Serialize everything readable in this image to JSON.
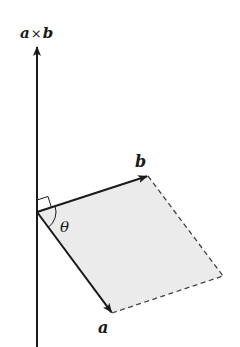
{
  "diagram": {
    "labels": {
      "cross_product": "a×b",
      "cross_a": "a",
      "cross_times": "×",
      "cross_b": "b",
      "vector_a": "a",
      "vector_b": "b",
      "angle": "θ"
    },
    "points": {
      "origin": [
        37,
        212
      ],
      "axis_top": [
        37,
        46
      ],
      "axis_bottom": [
        37,
        347
      ],
      "b_tip": [
        148,
        176
      ],
      "a_tip": [
        112,
        313
      ],
      "far_corner": [
        223,
        276
      ]
    },
    "colors": {
      "stroke": "#1a1a1a",
      "fill": "#ebebeb",
      "dashed_edge": "#444444"
    },
    "elements": [
      {
        "name": "cross-product-axis",
        "style": "solid arrow"
      },
      {
        "name": "vector-b",
        "style": "solid arrow"
      },
      {
        "name": "vector-a",
        "style": "solid arrow"
      },
      {
        "name": "parallelogram-edge-b-side",
        "style": "dashed"
      },
      {
        "name": "parallelogram-edge-a-side",
        "style": "dashed"
      },
      {
        "name": "right-angle-marker",
        "style": "square"
      },
      {
        "name": "angle-arc",
        "style": "arc"
      }
    ]
  }
}
